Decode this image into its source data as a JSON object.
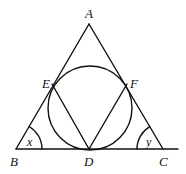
{
  "diagram": {
    "points": {
      "A": {
        "label": "A"
      },
      "B": {
        "label": "B"
      },
      "C": {
        "label": "C"
      },
      "D": {
        "label": "D"
      },
      "E": {
        "label": "E"
      },
      "F": {
        "label": "F"
      }
    },
    "angles": {
      "B": {
        "label": "x"
      },
      "C": {
        "label": "y"
      }
    },
    "colors": {
      "stroke": "#111111",
      "background": "#ffffff"
    }
  }
}
